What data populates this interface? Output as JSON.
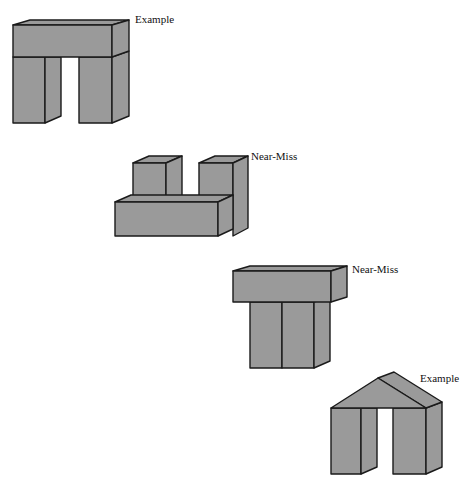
{
  "figures": [
    {
      "id": "arch-1",
      "kind": "arch",
      "label": "Example"
    },
    {
      "id": "near-miss-1",
      "kind": "two-blocks-on-base",
      "label": "Near-Miss"
    },
    {
      "id": "near-miss-2",
      "kind": "slab-on-touching-pillars",
      "label": "Near-Miss"
    },
    {
      "id": "arch-2",
      "kind": "arch-with-wedge-top",
      "label": "Example"
    }
  ],
  "colors": {
    "block_fill": "#9a9a9a",
    "edge": "#1a1a1a",
    "background": "#ffffff"
  }
}
